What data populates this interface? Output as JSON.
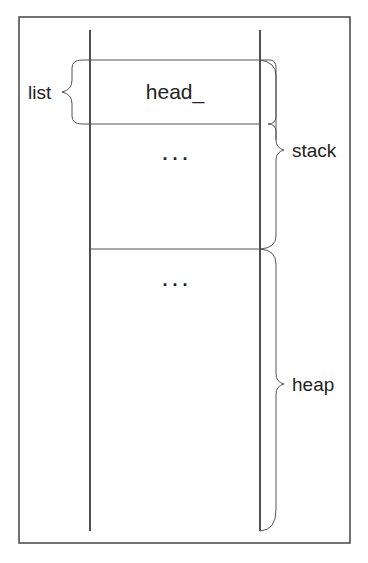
{
  "diagram": {
    "colors": {
      "line": "#222222",
      "thin_line": "#555555",
      "background": "#ffffff"
    },
    "cells": [
      {
        "id": "head",
        "label": "head_"
      },
      {
        "id": "stack-ellipsis",
        "label": ". . ."
      },
      {
        "id": "heap-ellipsis",
        "label": ". . ."
      }
    ],
    "braces": [
      {
        "id": "list",
        "label": "list",
        "side": "left"
      },
      {
        "id": "stack",
        "label": "stack",
        "side": "right"
      },
      {
        "id": "heap",
        "label": "heap",
        "side": "right"
      }
    ]
  }
}
